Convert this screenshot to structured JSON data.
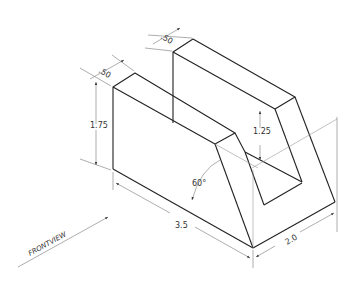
{
  "drawing": {
    "type": "isometric-technical-drawing",
    "dimensions": {
      "front_slot_width": ".50",
      "back_wall_thickness": ".50",
      "front_height": "1.75",
      "notch_depth": "1.25",
      "angle": "60°",
      "length": "3.5",
      "depth": "2.0"
    },
    "view_label": "FRONTVIEW"
  }
}
